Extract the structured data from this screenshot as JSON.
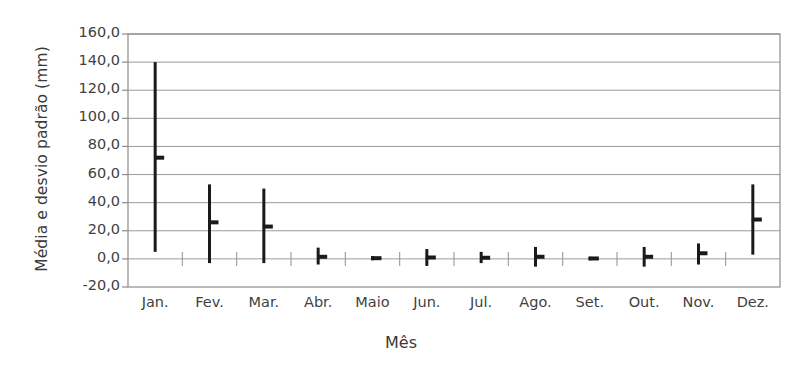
{
  "chart_data": {
    "type": "bar",
    "title": "",
    "subtitle": "",
    "xlabel": "Mês",
    "ylabel": "Média e desvio padrão (mm)",
    "categories": [
      "Jan.",
      "Fev.",
      "Mar.",
      "Abr.",
      "Maio",
      "Jun.",
      "Jul.",
      "Ago.",
      "Set.",
      "Out.",
      "Nov.",
      "Dez."
    ],
    "series": [
      {
        "name": "Média",
        "values": [
          72.0,
          26.0,
          23.0,
          1.5,
          0.5,
          1.0,
          0.8,
          1.5,
          0.3,
          1.5,
          4.0,
          28.0
        ]
      },
      {
        "name": "Desvio padrão",
        "values": [
          67.0,
          29.0,
          26.0,
          6.0,
          2.5,
          6.0,
          4.0,
          7.0,
          2.0,
          7.0,
          8.0,
          25.0
        ]
      }
    ],
    "error_bars": [
      {
        "category": "Jan.",
        "mean": 72.0,
        "low": 5.0,
        "high": 140.0
      },
      {
        "category": "Fev.",
        "mean": 26.0,
        "low": -3.0,
        "high": 53.0
      },
      {
        "category": "Mar.",
        "mean": 23.0,
        "low": -3.0,
        "high": 50.0
      },
      {
        "category": "Abr.",
        "mean": 1.5,
        "low": -4.0,
        "high": 8.0
      },
      {
        "category": "Maio",
        "mean": 0.5,
        "low": -1.0,
        "high": 2.0
      },
      {
        "category": "Jun.",
        "mean": 1.0,
        "low": -5.0,
        "high": 7.0
      },
      {
        "category": "Jul.",
        "mean": 0.8,
        "low": -3.0,
        "high": 5.0
      },
      {
        "category": "Ago.",
        "mean": 1.5,
        "low": -5.5,
        "high": 8.5
      },
      {
        "category": "Set.",
        "mean": 0.3,
        "low": -1.0,
        "high": 1.5
      },
      {
        "category": "Out.",
        "mean": 1.5,
        "low": -5.5,
        "high": 8.5
      },
      {
        "category": "Nov.",
        "mean": 4.0,
        "low": -4.0,
        "high": 11.0
      },
      {
        "category": "Dez.",
        "mean": 28.0,
        "low": 3.0,
        "high": 53.0
      }
    ],
    "yticks": [
      "160,0",
      "140,0",
      "120,0",
      "100,0",
      "80,0",
      "60,0",
      "40,0",
      "20,0",
      "0,0",
      "-20,0"
    ],
    "ytick_values": [
      160,
      140,
      120,
      100,
      80,
      60,
      40,
      20,
      0,
      -20
    ],
    "ylim": [
      -20,
      160
    ],
    "ystep": 20,
    "grid": true,
    "grid_axis": "y",
    "legend": false,
    "legend_position": "none",
    "colors": {
      "bar": "#1a1a1a",
      "grid": "#9a9a9a",
      "frame": "#8c8c8c",
      "text": "#3f3f3f",
      "background": "#ffffff"
    }
  }
}
